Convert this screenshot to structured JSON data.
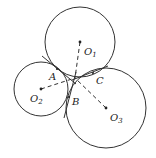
{
  "diagram": {
    "circles": [
      {
        "id": "O1",
        "label": "O",
        "sub": "1",
        "cx": 80,
        "cy": 42,
        "r": 35
      },
      {
        "id": "O2",
        "label": "O",
        "sub": "2",
        "cx": 41,
        "cy": 89,
        "r": 27
      },
      {
        "id": "O3",
        "label": "O",
        "sub": "3",
        "cx": 106,
        "cy": 108,
        "r": 40
      }
    ],
    "points": [
      {
        "id": "A",
        "label": "A",
        "x": 57,
        "y": 69
      },
      {
        "id": "B",
        "label": "B",
        "x": 69,
        "y": 97
      },
      {
        "id": "C",
        "label": "C",
        "x": 93,
        "y": 73
      }
    ],
    "center_label": {
      "x": 74,
      "y": 78
    },
    "stroke_color": "#333333"
  }
}
